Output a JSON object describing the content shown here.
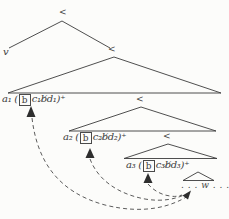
{
  "colors": {
    "ink": "#3b3b3b",
    "paper": "#fcfcfa"
  },
  "tree": {
    "root_symbol": "<",
    "left_leaf": "v",
    "levels": [
      {
        "node_symbol": "<",
        "label_prefix": "a₁ (",
        "label_box": "b",
        "label_suffix": "c₁b̸d₁)⁺"
      },
      {
        "node_symbol": "<",
        "label_prefix": "a₂ (",
        "label_box": "b",
        "label_suffix": "c₂b̸d₂)⁺"
      },
      {
        "node_symbol": "<",
        "label_prefix": "a₃ (",
        "label_box": "b",
        "label_suffix": "c₃b̸d₃)⁺"
      }
    ],
    "tail_word": ". . . w . . ."
  }
}
